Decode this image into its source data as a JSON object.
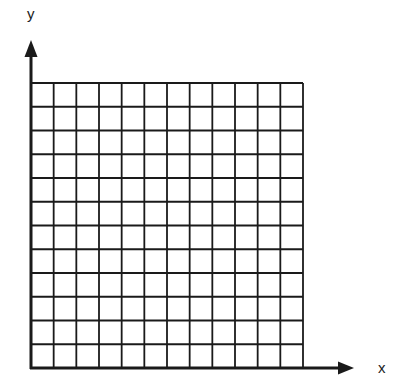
{
  "diagram": {
    "type": "empty-coordinate-grid",
    "x_axis_label": "x",
    "y_axis_label": "y",
    "columns": 12,
    "rows": 12,
    "colors": {
      "line": "#1a1a1a",
      "background": "#ffffff"
    }
  }
}
